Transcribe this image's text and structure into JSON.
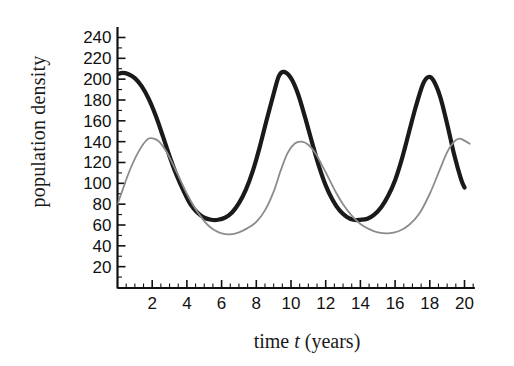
{
  "chart_data": {
    "type": "line",
    "title": "",
    "xlabel": "time t (years)",
    "xlabel_parts": {
      "pre": "time ",
      "italic": "t",
      "post": " (years)"
    },
    "ylabel": "population density",
    "xlim": [
      0,
      20.6
    ],
    "ylim": [
      0,
      250
    ],
    "xticks": [
      2,
      4,
      6,
      8,
      10,
      12,
      14,
      16,
      18,
      20
    ],
    "xtick_labels": [
      "2",
      "4",
      "6",
      "8",
      "10",
      "12",
      "14",
      "16",
      "18",
      "20"
    ],
    "xminor_step": 0.5,
    "yticks": [
      20,
      40,
      60,
      80,
      100,
      120,
      140,
      160,
      180,
      200,
      220,
      240
    ],
    "ytick_labels": [
      "20",
      "40",
      "60",
      "80",
      "100",
      "120",
      "140",
      "160",
      "180",
      "200",
      "220",
      "240"
    ],
    "yminor_step": 10,
    "grid": false,
    "legend": "none",
    "series": [
      {
        "name": "thick-black-curve",
        "color": "#1a1a1a",
        "width": 4.2,
        "style": "solid",
        "x": [
          0,
          0.3,
          0.6,
          1.0,
          1.4,
          1.8,
          2.2,
          2.6,
          3.0,
          3.4,
          3.8,
          4.2,
          4.6,
          5.0,
          5.4,
          5.8,
          6.2,
          6.6,
          7.0,
          7.4,
          7.8,
          8.2,
          8.6,
          9.0,
          9.3,
          9.6,
          10.0,
          10.4,
          10.8,
          11.2,
          11.6,
          12.0,
          12.4,
          12.8,
          13.2,
          13.6,
          14.0,
          14.4,
          14.8,
          15.2,
          15.6,
          16.0,
          16.4,
          16.8,
          17.2,
          17.6,
          17.9,
          18.2,
          18.6,
          19.0,
          19.4,
          19.8,
          20.0
        ],
        "y": [
          205,
          206,
          205,
          201,
          193,
          181,
          165,
          146,
          126,
          108,
          93,
          80,
          72,
          67,
          65,
          65,
          67,
          72,
          81,
          94,
          112,
          135,
          161,
          186,
          203,
          207,
          201,
          186,
          164,
          140,
          117,
          98,
          84,
          74,
          68,
          65,
          65,
          66,
          70,
          77,
          88,
          103,
          124,
          149,
          174,
          195,
          202,
          199,
          183,
          157,
          128,
          104,
          96
        ]
      },
      {
        "name": "thin-gray-curve",
        "color": "#8c8c8c",
        "width": 1.8,
        "style": "solid",
        "x": [
          0,
          0.3,
          0.6,
          0.9,
          1.2,
          1.5,
          1.8,
          2.1,
          2.4,
          2.8,
          3.2,
          3.6,
          4.0,
          4.4,
          4.8,
          5.2,
          5.6,
          6.0,
          6.5,
          7.0,
          7.5,
          8.0,
          8.5,
          9.0,
          9.4,
          9.8,
          10.2,
          10.6,
          11.0,
          11.4,
          11.8,
          12.2,
          12.6,
          13.0,
          13.5,
          14.0,
          14.5,
          15.0,
          15.6,
          16.2,
          16.8,
          17.4,
          18.0,
          18.5,
          19.0,
          19.4,
          19.7,
          20.0,
          20.3
        ],
        "y": [
          80,
          94,
          108,
          120,
          130,
          138,
          143,
          143,
          140,
          131,
          118,
          104,
          90,
          78,
          68,
          60,
          55,
          52,
          51,
          53,
          57,
          63,
          74,
          92,
          112,
          129,
          138,
          140,
          137,
          129,
          117,
          104,
          91,
          80,
          69,
          61,
          56,
          53,
          52,
          54,
          60,
          71,
          90,
          110,
          130,
          140,
          143,
          141,
          138
        ]
      }
    ]
  },
  "axes": {
    "axis_color": "#111111",
    "background": "#ffffff"
  }
}
